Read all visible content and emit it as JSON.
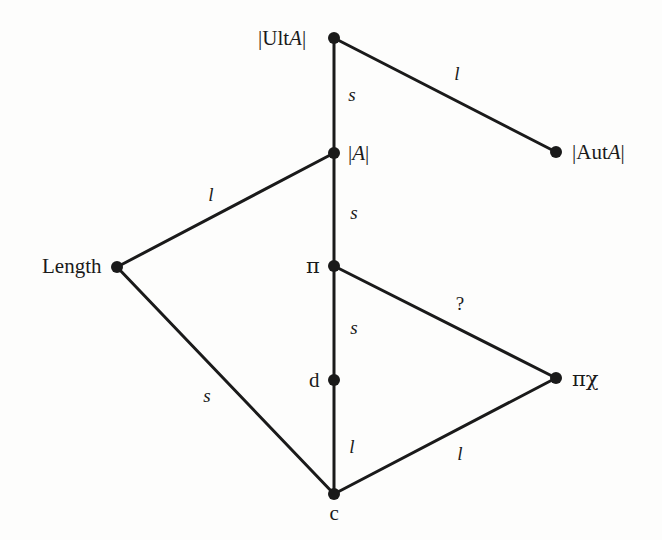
{
  "diagram": {
    "type": "undirected-graph",
    "background_color": "#fdfdfc",
    "stroke_color": "#1a1a1a",
    "nodes": [
      {
        "id": "ultA",
        "label": "|UltA|",
        "label_html": "|Ult<i>A</i>|",
        "x": 334,
        "y": 38,
        "label_x": 306,
        "label_y": 38,
        "label_anchor": "right"
      },
      {
        "id": "autA",
        "label": "|AutA|",
        "label_html": "|Aut<i>A</i>|",
        "x": 556,
        "y": 152,
        "label_x": 572,
        "label_y": 152,
        "label_anchor": "left"
      },
      {
        "id": "modA",
        "label": "|A|",
        "label_html": "|<i>A</i>|",
        "x": 334,
        "y": 153,
        "label_x": 348,
        "label_y": 153,
        "label_anchor": "left"
      },
      {
        "id": "length",
        "label": "Length",
        "label_html": "Length",
        "x": 117,
        "y": 267,
        "label_x": 101,
        "label_y": 266,
        "label_anchor": "right"
      },
      {
        "id": "pi",
        "label": "π",
        "label_html": "π",
        "x": 334,
        "y": 266,
        "label_x": 320,
        "label_y": 266,
        "label_anchor": "right"
      },
      {
        "id": "pichi",
        "label": "πχ",
        "label_html": "πχ",
        "x": 556,
        "y": 378,
        "label_x": 572,
        "label_y": 379,
        "label_anchor": "left"
      },
      {
        "id": "d",
        "label": "d",
        "label_html": "d",
        "x": 334,
        "y": 380,
        "label_x": 320,
        "label_y": 380,
        "label_anchor": "right"
      },
      {
        "id": "c",
        "label": "c",
        "label_html": "c",
        "x": 334,
        "y": 494,
        "label_x": 334,
        "label_y": 513,
        "label_anchor": "below"
      }
    ],
    "edges": [
      {
        "id": "e-ultA-modA",
        "from": "ultA",
        "to": "modA",
        "label": "s",
        "label_x": 352,
        "label_y": 94,
        "style": "italic"
      },
      {
        "id": "e-ultA-autA",
        "from": "ultA",
        "to": "autA",
        "label": "l",
        "label_x": 457,
        "label_y": 73,
        "style": "italic"
      },
      {
        "id": "e-modA-pi",
        "from": "modA",
        "to": "pi",
        "label": "s",
        "label_x": 354,
        "label_y": 212,
        "style": "italic"
      },
      {
        "id": "e-length-modA",
        "from": "length",
        "to": "modA",
        "label": "l",
        "label_x": 211,
        "label_y": 194,
        "style": "italic"
      },
      {
        "id": "e-pi-d",
        "from": "pi",
        "to": "d",
        "label": "s",
        "label_x": 354,
        "label_y": 327,
        "style": "italic"
      },
      {
        "id": "e-pi-pichi",
        "from": "pi",
        "to": "pichi",
        "label": "?",
        "label_x": 460,
        "label_y": 303,
        "style": "upright"
      },
      {
        "id": "e-length-c",
        "from": "length",
        "to": "c",
        "label": "s",
        "label_x": 207,
        "label_y": 395,
        "style": "italic"
      },
      {
        "id": "e-d-c",
        "from": "d",
        "to": "c",
        "label": "l",
        "label_x": 352,
        "label_y": 446,
        "style": "italic"
      },
      {
        "id": "e-c-pichi",
        "from": "c",
        "to": "pichi",
        "label": "l",
        "label_x": 460,
        "label_y": 453,
        "style": "italic"
      }
    ]
  }
}
